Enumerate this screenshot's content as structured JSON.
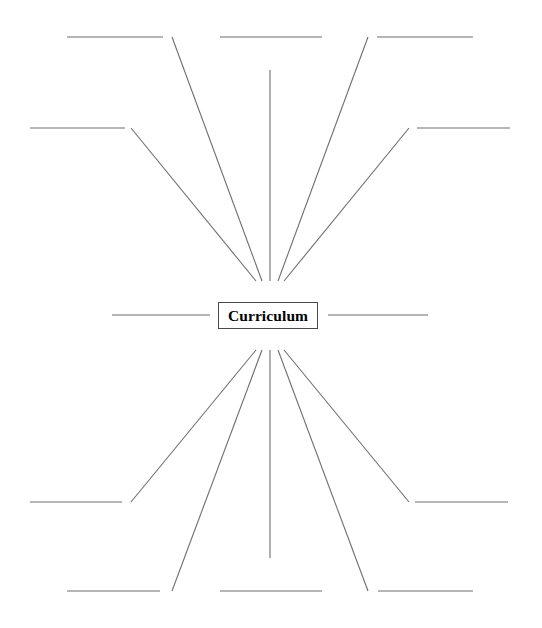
{
  "document": {
    "type": "concept-map-worksheet",
    "title": "Curriculum",
    "background_color": "#ffffff",
    "line_color": "#6e6e6e",
    "border_color": "#4a4a4a",
    "text_color": "#000000"
  },
  "center_node": {
    "label": "Curriculum",
    "x": 218,
    "y": 302,
    "width": 100,
    "height": 27
  },
  "branches": [
    {
      "id": "branch-upper-left-outer",
      "position": "upper-left-outer",
      "label": "",
      "spoke": {
        "x1": 262,
        "y1": 281,
        "x2": 172,
        "y2": 37
      },
      "rule": {
        "x1": 67,
        "y1": 37,
        "x2": 163,
        "y2": 37
      }
    },
    {
      "id": "branch-upper-left-inner",
      "position": "upper-left-inner",
      "label": "",
      "spoke": {
        "x1": 256,
        "y1": 281,
        "x2": 131,
        "y2": 128
      },
      "rule": {
        "x1": 30,
        "y1": 128,
        "x2": 125,
        "y2": 128
      }
    },
    {
      "id": "branch-upper-center",
      "position": "upper-center",
      "label": "",
      "spoke": {
        "x1": 270,
        "y1": 281,
        "x2": 270,
        "y2": 70
      },
      "rule": {
        "x1": 220,
        "y1": 37,
        "x2": 322,
        "y2": 37
      }
    },
    {
      "id": "branch-upper-right-inner",
      "position": "upper-right-inner",
      "label": "",
      "spoke": {
        "x1": 284,
        "y1": 281,
        "x2": 409,
        "y2": 128
      },
      "rule": {
        "x1": 417,
        "y1": 128,
        "x2": 510,
        "y2": 128
      }
    },
    {
      "id": "branch-upper-right-outer",
      "position": "upper-right-outer",
      "label": "",
      "spoke": {
        "x1": 278,
        "y1": 281,
        "x2": 368,
        "y2": 37
      },
      "rule": {
        "x1": 377,
        "y1": 37,
        "x2": 473,
        "y2": 37
      }
    },
    {
      "id": "branch-left",
      "position": "left",
      "label": "",
      "spoke": null,
      "rule": {
        "x1": 112,
        "y1": 315,
        "x2": 210,
        "y2": 315
      }
    },
    {
      "id": "branch-right",
      "position": "right",
      "label": "",
      "spoke": null,
      "rule": {
        "x1": 328,
        "y1": 315,
        "x2": 428,
        "y2": 315
      }
    },
    {
      "id": "branch-lower-left-outer",
      "position": "lower-left-outer",
      "label": "",
      "spoke": {
        "x1": 262,
        "y1": 350,
        "x2": 172,
        "y2": 591
      },
      "rule": {
        "x1": 67,
        "y1": 591,
        "x2": 160,
        "y2": 591
      }
    },
    {
      "id": "branch-lower-left-inner",
      "position": "lower-left-inner",
      "label": "",
      "spoke": {
        "x1": 256,
        "y1": 350,
        "x2": 131,
        "y2": 502
      },
      "rule": {
        "x1": 30,
        "y1": 502,
        "x2": 122,
        "y2": 502
      }
    },
    {
      "id": "branch-lower-center",
      "position": "lower-center",
      "label": "",
      "spoke": {
        "x1": 270,
        "y1": 350,
        "x2": 270,
        "y2": 558
      },
      "rule": {
        "x1": 220,
        "y1": 591,
        "x2": 322,
        "y2": 591
      }
    },
    {
      "id": "branch-lower-right-inner",
      "position": "lower-right-inner",
      "label": "",
      "spoke": {
        "x1": 284,
        "y1": 350,
        "x2": 409,
        "y2": 502
      },
      "rule": {
        "x1": 415,
        "y1": 502,
        "x2": 508,
        "y2": 502
      }
    },
    {
      "id": "branch-lower-right-outer",
      "position": "lower-right-outer",
      "label": "",
      "spoke": {
        "x1": 278,
        "y1": 350,
        "x2": 368,
        "y2": 591
      },
      "rule": {
        "x1": 378,
        "y1": 591,
        "x2": 473,
        "y2": 591
      }
    }
  ]
}
